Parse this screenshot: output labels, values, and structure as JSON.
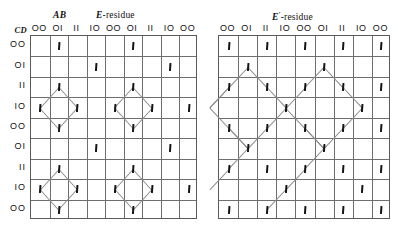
{
  "figure": {
    "left_panel": {
      "title_main": "E",
      "title_rest": "-residue",
      "ab_label": "AB",
      "cd_label": "CD",
      "col_headers": [
        "OO",
        "OI",
        "II",
        "IO",
        "OO",
        "OI",
        "II",
        "IO",
        "OO"
      ],
      "row_headers": [
        "OO",
        "OI",
        "II",
        "IO",
        "OO",
        "OI",
        "II",
        "IO",
        "OO"
      ]
    },
    "right_panel": {
      "title_main": "E",
      "title_sup": "′",
      "title_rest": "-residue",
      "col_headers": [
        "OO",
        "OI",
        "II",
        "IO",
        "OO",
        "OI",
        "II",
        "IO",
        "OO"
      ],
      "row_headers": [
        "OO",
        "OI",
        "II",
        "IO",
        "OO",
        "OI",
        "II",
        "IO",
        "OO"
      ]
    }
  },
  "chart_data": {
    "type": "heatmap",
    "xlabel": "AB",
    "ylabel": "CD",
    "grid": true,
    "legend": "none",
    "rows": 9,
    "cols": 9,
    "categories": [
      "OO",
      "OI",
      "II",
      "IO",
      "OO",
      "OI",
      "II",
      "IO",
      "OO"
    ],
    "series": [
      {
        "name": "E-residue",
        "marks": [
          [
            1,
            2
          ],
          [
            1,
            6
          ],
          [
            2,
            4
          ],
          [
            2,
            8
          ],
          [
            3,
            2
          ],
          [
            3,
            6
          ],
          [
            4,
            1
          ],
          [
            4,
            3
          ],
          [
            4,
            5
          ],
          [
            4,
            7
          ],
          [
            4,
            9
          ],
          [
            5,
            2
          ],
          [
            5,
            6
          ],
          [
            6,
            4
          ],
          [
            6,
            8
          ],
          [
            7,
            2
          ],
          [
            7,
            6
          ],
          [
            8,
            1
          ],
          [
            8,
            3
          ],
          [
            8,
            5
          ],
          [
            8,
            7
          ],
          [
            8,
            9
          ],
          [
            9,
            2
          ],
          [
            9,
            6
          ]
        ],
        "links": [
          [
            3,
            2,
            4,
            1
          ],
          [
            3,
            2,
            4,
            3
          ],
          [
            4,
            1,
            5,
            2
          ],
          [
            4,
            3,
            5,
            2
          ],
          [
            3,
            6,
            4,
            5
          ],
          [
            3,
            6,
            4,
            7
          ],
          [
            4,
            5,
            5,
            6
          ],
          [
            4,
            7,
            5,
            6
          ],
          [
            7,
            2,
            8,
            1
          ],
          [
            7,
            2,
            8,
            3
          ],
          [
            8,
            1,
            9,
            2
          ],
          [
            8,
            3,
            9,
            2
          ],
          [
            7,
            6,
            8,
            5
          ],
          [
            7,
            6,
            8,
            7
          ],
          [
            8,
            5,
            9,
            6
          ],
          [
            8,
            7,
            9,
            6
          ]
        ]
      },
      {
        "name": "E′-residue",
        "marks": [
          [
            1,
            1
          ],
          [
            1,
            3
          ],
          [
            1,
            5
          ],
          [
            1,
            7
          ],
          [
            1,
            9
          ],
          [
            2,
            2
          ],
          [
            2,
            6
          ],
          [
            3,
            1
          ],
          [
            3,
            3
          ],
          [
            3,
            5
          ],
          [
            3,
            7
          ],
          [
            3,
            9
          ],
          [
            4,
            4
          ],
          [
            4,
            8
          ],
          [
            5,
            1
          ],
          [
            5,
            3
          ],
          [
            5,
            5
          ],
          [
            5,
            7
          ],
          [
            5,
            9
          ],
          [
            6,
            2
          ],
          [
            6,
            6
          ],
          [
            7,
            1
          ],
          [
            7,
            3
          ],
          [
            7,
            5
          ],
          [
            7,
            7
          ],
          [
            7,
            9
          ],
          [
            8,
            4
          ],
          [
            8,
            8
          ],
          [
            9,
            1
          ],
          [
            9,
            3
          ],
          [
            9,
            5
          ],
          [
            9,
            7
          ],
          [
            9,
            9
          ]
        ],
        "links": [
          [
            2,
            2,
            3,
            1
          ],
          [
            2,
            2,
            3,
            3
          ],
          [
            3,
            1,
            4,
            0
          ],
          [
            3,
            3,
            4,
            4
          ],
          [
            4,
            4,
            5,
            3
          ],
          [
            4,
            4,
            5,
            5
          ],
          [
            5,
            3,
            6,
            2
          ],
          [
            5,
            5,
            6,
            6
          ],
          [
            6,
            2,
            7,
            1
          ],
          [
            6,
            6,
            7,
            5
          ],
          [
            7,
            1,
            8,
            0
          ],
          [
            7,
            5,
            8,
            4
          ],
          [
            3,
            1,
            4,
            0
          ],
          [
            5,
            1,
            4,
            0
          ],
          [
            5,
            1,
            6,
            2
          ],
          [
            8,
            4,
            9,
            3
          ],
          [
            4,
            4,
            3,
            5
          ],
          [
            3,
            5,
            2,
            6
          ],
          [
            2,
            6,
            3,
            7
          ],
          [
            3,
            7,
            4,
            8
          ],
          [
            4,
            8,
            5,
            7
          ],
          [
            5,
            7,
            6,
            6
          ],
          [
            6,
            6,
            5,
            5
          ],
          [
            6,
            2,
            5,
            1
          ]
        ]
      }
    ]
  }
}
